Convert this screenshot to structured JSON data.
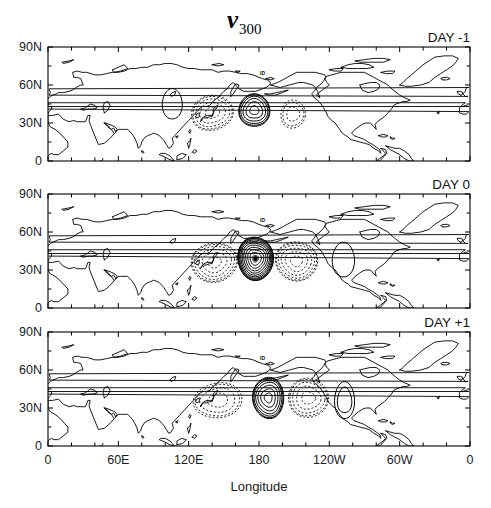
{
  "figure": {
    "title": "v",
    "title_subscript": "300",
    "background": "#ffffff",
    "line_color": "#000000"
  },
  "axes": {
    "xlabel": "Longitude",
    "ylabel": "",
    "x_ticklabels": [
      "0",
      "60E",
      "120E",
      "180",
      "120W",
      "60W",
      "0"
    ],
    "x_tickvalues": [
      0,
      60,
      120,
      180,
      240,
      300,
      360
    ],
    "x_minor_step_deg": 20,
    "y_ticklabels": [
      "90N",
      "60N",
      "30N",
      "0"
    ],
    "y_tickvalues": [
      90,
      60,
      30,
      0
    ],
    "xlim": [
      0,
      360
    ],
    "ylim": [
      0,
      90
    ],
    "grid": false
  },
  "panels": [
    {
      "label": "DAY -1",
      "name": "panel-day-minus-1"
    },
    {
      "label": "DAY 0",
      "name": "panel-day-0"
    },
    {
      "label": "DAY +1",
      "name": "panel-day-plus-1"
    }
  ],
  "map_annotation": {
    "text": "ID",
    "lon": 183,
    "lat": 68
  },
  "chart_data": {
    "type": "contour",
    "title": "v300",
    "xlabel": "Longitude",
    "ylabel": "Latitude",
    "xlim": [
      0,
      360
    ],
    "ylim": [
      0,
      90
    ],
    "grid": false,
    "contour_style": {
      "positive": "solid",
      "negative": "dashed",
      "zero_contour": false
    },
    "panels": [
      {
        "label": "DAY -1",
        "centers": [
          {
            "lon": 140,
            "lat": 38,
            "sign": -1,
            "rings": 5,
            "amplitude": 5,
            "rx": 19,
            "ry": 16,
            "rot": -12
          },
          {
            "lon": 176,
            "lat": 40,
            "sign": 1,
            "rings": 6,
            "amplitude": 7,
            "rx": 14,
            "ry": 15,
            "rot": 0
          },
          {
            "lon": 209,
            "lat": 37,
            "sign": -1,
            "rings": 3,
            "amplitude": 3,
            "rx": 11,
            "ry": 13,
            "rot": 8
          },
          {
            "lon": 106,
            "lat": 45,
            "sign": 1,
            "rings": 1,
            "amplitude": 1,
            "rx": 9,
            "ry": 14,
            "rot": 0
          }
        ]
      },
      {
        "label": "DAY 0",
        "centers": [
          {
            "lon": 142,
            "lat": 36,
            "sign": -1,
            "rings": 6,
            "amplitude": 6,
            "rx": 21,
            "ry": 18,
            "rot": -10
          },
          {
            "lon": 177,
            "lat": 39,
            "sign": 1,
            "rings": 11,
            "amplitude": 13,
            "rx": 16,
            "ry": 20,
            "rot": -4
          },
          {
            "lon": 212,
            "lat": 37,
            "sign": -1,
            "rings": 6,
            "amplitude": 6,
            "rx": 19,
            "ry": 18,
            "rot": 10
          },
          {
            "lon": 252,
            "lat": 38,
            "sign": 1,
            "rings": 1,
            "amplitude": 1,
            "rx": 10,
            "ry": 16,
            "rot": 0
          }
        ]
      },
      {
        "label": "DAY +1",
        "centers": [
          {
            "lon": 145,
            "lat": 36,
            "sign": -1,
            "rings": 4,
            "amplitude": 4,
            "rx": 22,
            "ry": 16,
            "rot": -8
          },
          {
            "lon": 188,
            "lat": 38,
            "sign": 1,
            "rings": 7,
            "amplitude": 9,
            "rx": 14,
            "ry": 19,
            "rot": -2
          },
          {
            "lon": 222,
            "lat": 38,
            "sign": -1,
            "rings": 5,
            "amplitude": 5,
            "rx": 18,
            "ry": 18,
            "rot": 8
          },
          {
            "lon": 253,
            "lat": 36,
            "sign": 1,
            "rings": 2,
            "amplitude": 2,
            "rx": 9,
            "ry": 17,
            "rot": 0
          }
        ]
      }
    ]
  }
}
